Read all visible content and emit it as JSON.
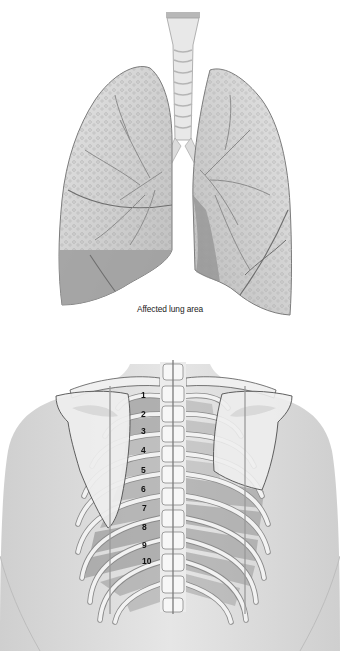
{
  "lungs": {
    "caption": "Affected lung area",
    "colors": {
      "lung_base": "#c8c8c8",
      "lung_light": "#dedede",
      "affected_area": "#9e9e9e",
      "outline": "#6e6e6e",
      "trachea": "#e6e6e6"
    }
  },
  "back": {
    "rib_labels": [
      "1",
      "2",
      "3",
      "4",
      "5",
      "6",
      "7",
      "8",
      "9",
      "10"
    ],
    "colors": {
      "skin": "#d8d8d8",
      "bone": "#f2f2f2",
      "intercostal_shade": "#9a9a9a",
      "highlight_region": "#a8a8a8",
      "guide_line": "#7a7a7a"
    }
  }
}
